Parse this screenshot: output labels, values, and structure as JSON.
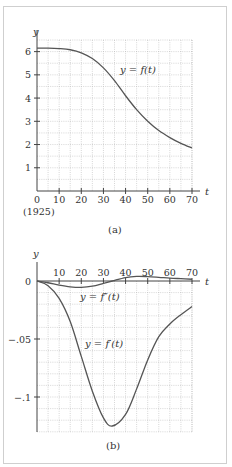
{
  "chart_data": [
    {
      "id": "a",
      "type": "line",
      "caption": "(a)",
      "title": "",
      "xlabel": "t",
      "ylabel": "y",
      "x_ticks": [
        0,
        10,
        20,
        30,
        40,
        50,
        60,
        70
      ],
      "x_tick_labels": [
        "0",
        "10",
        "20",
        "30",
        "40",
        "50",
        "60",
        "70"
      ],
      "x_origin_note": "(1925)",
      "y_ticks": [
        1,
        2,
        3,
        4,
        5,
        6
      ],
      "y_tick_labels": [
        "1",
        "2",
        "3",
        "4",
        "5",
        "6"
      ],
      "xlim": [
        0,
        70
      ],
      "ylim": [
        0,
        6.5
      ],
      "grid": true,
      "series": [
        {
          "name": "y = f(t)",
          "label": "y = f(t)",
          "x": [
            0,
            5,
            10,
            15,
            20,
            25,
            30,
            35,
            40,
            45,
            50,
            55,
            60,
            65,
            70
          ],
          "values": [
            6.15,
            6.15,
            6.13,
            6.08,
            5.95,
            5.7,
            5.3,
            4.75,
            4.1,
            3.5,
            3.0,
            2.6,
            2.3,
            2.05,
            1.85
          ]
        }
      ]
    },
    {
      "id": "b",
      "type": "line",
      "caption": "(b)",
      "title": "",
      "xlabel": "t",
      "ylabel": "y",
      "x_ticks": [
        10,
        20,
        30,
        40,
        50,
        60,
        70
      ],
      "x_tick_labels": [
        "10",
        "20",
        "30",
        "40",
        "50",
        "60",
        "70"
      ],
      "y_ticks": [
        0,
        -0.05,
        -0.1
      ],
      "y_tick_labels": [
        "0",
        "-.05",
        "-.1"
      ],
      "xlim": [
        0,
        70
      ],
      "ylim": [
        -0.13,
        0.0
      ],
      "grid": true,
      "series": [
        {
          "name": "y = f''(t)",
          "label": "y = f″(t)",
          "x": [
            0,
            5,
            10,
            15,
            20,
            25,
            30,
            34,
            40,
            45,
            50,
            55,
            60,
            65,
            70
          ],
          "values": [
            0,
            -0.0015,
            -0.0035,
            -0.005,
            -0.0055,
            -0.0045,
            -0.002,
            0,
            0.003,
            0.004,
            0.0038,
            0.0032,
            0.0025,
            0.002,
            0.0015
          ]
        },
        {
          "name": "y = f'(t)",
          "label": "y = f′(t)",
          "x": [
            0,
            5,
            10,
            15,
            20,
            25,
            30,
            34,
            40,
            45,
            50,
            55,
            60,
            65,
            70
          ],
          "values": [
            0,
            -0.004,
            -0.015,
            -0.035,
            -0.065,
            -0.095,
            -0.118,
            -0.125,
            -0.115,
            -0.093,
            -0.068,
            -0.048,
            -0.037,
            -0.029,
            -0.022
          ]
        }
      ]
    }
  ]
}
